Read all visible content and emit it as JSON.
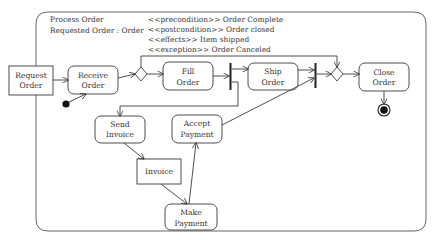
{
  "frame": {
    "activity_name": "Process Order",
    "parameter": "Requested Order : Order",
    "constraints": [
      "<<precondition>> Order Complete",
      "<<postcondition>> Order closed",
      "<<effects>> Item shipped",
      "<<exception>> Order Canceled"
    ]
  },
  "nodes": {
    "request_order": {
      "type": "object",
      "line1": "Request",
      "line2": "Order"
    },
    "receive_order": {
      "type": "action",
      "line1": "Receive",
      "line2": "Order"
    },
    "fill_order": {
      "type": "action",
      "line1": "Fill",
      "line2": "Order"
    },
    "ship_order": {
      "type": "action",
      "line1": "Ship",
      "line2": "Order"
    },
    "close_order": {
      "type": "action",
      "line1": "Close",
      "line2": "Order"
    },
    "send_invoice": {
      "type": "action",
      "line1": "Send",
      "line2": "Invoice"
    },
    "invoice": {
      "type": "object",
      "line1": "Invoice"
    },
    "make_payment": {
      "type": "action",
      "line1": "Make",
      "line2": "Payment"
    },
    "accept_payment": {
      "type": "action",
      "line1": "Accept",
      "line2": "Payment"
    }
  },
  "control_nodes": {
    "initial": "initial-node",
    "final": "activity-final-node",
    "decision": "decision-node",
    "merge": "merge-node",
    "fork": "fork-bar",
    "join": "join-bar"
  },
  "colors": {
    "stroke": "#3a3a3a",
    "background": "#ffffff",
    "text": "#333333"
  }
}
